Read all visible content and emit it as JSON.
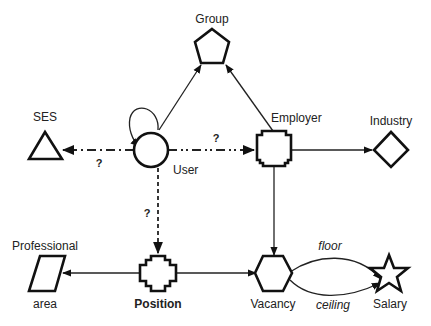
{
  "diagram": {
    "type": "entity-relationship graph",
    "nodes": [
      {
        "id": "group",
        "label": "Group",
        "shape": "pentagon"
      },
      {
        "id": "ses",
        "label": "SES",
        "shape": "triangle"
      },
      {
        "id": "user",
        "label": "User",
        "shape": "circle"
      },
      {
        "id": "employer",
        "label": "Employer",
        "shape": "notched-square"
      },
      {
        "id": "industry",
        "label": "Industry",
        "shape": "diamond"
      },
      {
        "id": "professional_area",
        "label_top": "Professional",
        "label_bottom": "area",
        "shape": "parallelogram"
      },
      {
        "id": "position",
        "label": "Position",
        "shape": "cross"
      },
      {
        "id": "vacancy",
        "label": "Vacancy",
        "shape": "hexagon"
      },
      {
        "id": "salary",
        "label": "Salary",
        "shape": "star"
      }
    ],
    "edges": [
      {
        "from": "user",
        "to": "user",
        "style": "solid",
        "label": ""
      },
      {
        "from": "user",
        "to": "group",
        "style": "solid",
        "label": ""
      },
      {
        "from": "employer",
        "to": "group",
        "style": "solid",
        "label": ""
      },
      {
        "from": "user",
        "to": "ses",
        "style": "dash-dot",
        "label": "?"
      },
      {
        "from": "user",
        "to": "employer",
        "style": "dash-dot-dot",
        "label": "?"
      },
      {
        "from": "employer",
        "to": "industry",
        "style": "solid",
        "label": ""
      },
      {
        "from": "user",
        "to": "position",
        "style": "dashed",
        "label": "?"
      },
      {
        "from": "employer",
        "to": "vacancy",
        "style": "solid",
        "label": ""
      },
      {
        "from": "position",
        "to": "professional_area",
        "style": "solid",
        "label": ""
      },
      {
        "from": "position",
        "to": "vacancy",
        "style": "solid",
        "label": ""
      },
      {
        "from": "vacancy",
        "to": "salary",
        "style": "solid-curve",
        "label": "floor"
      },
      {
        "from": "vacancy",
        "to": "salary",
        "style": "solid-curve",
        "label": "ceiling"
      }
    ]
  },
  "labels": {
    "group": "Group",
    "ses": "SES",
    "user": "User",
    "employer": "Employer",
    "industry": "Industry",
    "professional_top": "Professional",
    "professional_bottom": "area",
    "position": "Position",
    "vacancy": "Vacancy",
    "salary": "Salary",
    "q_ses": "?",
    "q_employer": "?",
    "q_position": "?",
    "floor": "floor",
    "ceiling": "ceiling"
  },
  "colors": {
    "stroke": "#111111",
    "background": "#ffffff",
    "text": "#222222"
  }
}
